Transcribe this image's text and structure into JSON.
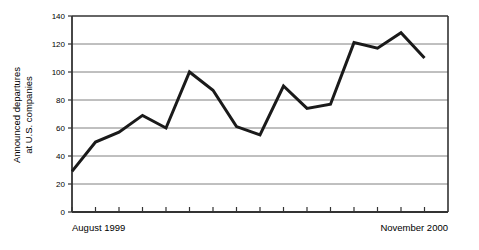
{
  "chart_data": {
    "type": "line",
    "title": "",
    "xlabel": "",
    "ylabel": "Announced departures at U.S. companies",
    "ylabel_line1": "Announced departures",
    "ylabel_line2": "at U.S. companies",
    "ylim": [
      0,
      140
    ],
    "ytick_labels": [
      "0",
      "20",
      "40",
      "60",
      "80",
      "100",
      "120",
      "140"
    ],
    "ytick_values": [
      0,
      20,
      40,
      60,
      80,
      100,
      120,
      140
    ],
    "grid": true,
    "legend": "none",
    "x_axis_start_label": "August 1999",
    "x_axis_end_label": "November 2000",
    "xtick_count": 16,
    "categories": [
      "Aug 1999",
      "Sep 1999",
      "Oct 1999",
      "Nov 1999",
      "Dec 1999",
      "Jan 2000",
      "Feb 2000",
      "Mar 2000",
      "Apr 2000",
      "May 2000",
      "Jun 2000",
      "Jul 2000",
      "Aug 2000",
      "Sep 2000",
      "Oct 2000",
      "Nov 2000"
    ],
    "values": [
      29,
      50,
      57,
      69,
      60,
      100,
      87,
      61,
      55,
      90,
      74,
      77,
      121,
      117,
      128,
      110
    ],
    "line_color": "#1a1a1a",
    "line_width": 3,
    "grid_color": "#808080",
    "axis_color": "#333333",
    "background_color": "#ffffff"
  }
}
